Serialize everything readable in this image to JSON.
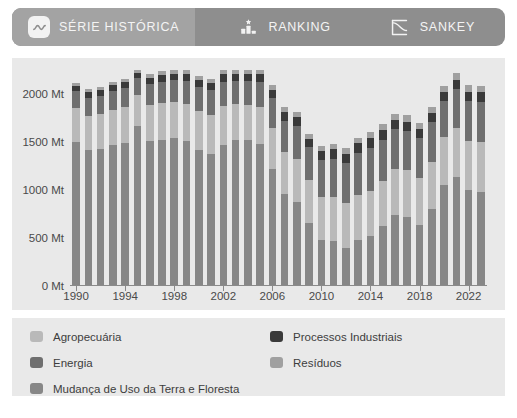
{
  "tabs": [
    {
      "label": "SÉRIE HISTÓRICA",
      "icon": "line-chart-icon",
      "active": true
    },
    {
      "label": "RANKING",
      "icon": "podium-star-icon",
      "active": false
    },
    {
      "label": "SANKEY",
      "icon": "sankey-curve-icon",
      "active": false
    }
  ],
  "colors": {
    "tabbar_bg": "#8e8e8e",
    "tab_active_bg": "#a3a3a3",
    "panel_bg": "#e9e9e9",
    "agropecuaria": "#b9b9b9",
    "energia": "#6f6f6f",
    "mudanca": "#878787",
    "processos": "#3a3a3a",
    "residuos": "#a0a0a0"
  },
  "chart_data": {
    "type": "bar",
    "stacked": true,
    "title": "",
    "xlabel": "",
    "ylabel": "",
    "ylim": [
      0,
      2250
    ],
    "yticks": [
      0,
      500,
      1000,
      1500,
      2000
    ],
    "ytick_labels": [
      "0 Mt",
      "500 Mt",
      "1000 Mt",
      "1500 Mt",
      "2000 Mt"
    ],
    "xtick_labels": [
      "1990",
      "1994",
      "1998",
      "2002",
      "2006",
      "2010",
      "2014",
      "2018",
      "2022"
    ],
    "grid": false,
    "legend_position": "below",
    "unit": "Mt",
    "categories": [
      1990,
      1991,
      1992,
      1993,
      1994,
      1995,
      1996,
      1997,
      1998,
      1999,
      2000,
      2001,
      2002,
      2003,
      2004,
      2005,
      2006,
      2007,
      2008,
      2009,
      2010,
      2011,
      2012,
      2013,
      2014,
      2015,
      2016,
      2017,
      2018,
      2019,
      2020,
      2021,
      2022,
      2023
    ],
    "series": [
      {
        "name": "Mudança de Uso da Terra e Floresta",
        "color": "#878787",
        "values": [
          1500,
          1420,
          1430,
          1470,
          1490,
          1960,
          1510,
          1520,
          1620,
          1520,
          1420,
          1380,
          1480,
          1700,
          1760,
          1640,
          1220,
          960,
          880,
          660,
          480,
          470,
          400,
          480,
          520,
          620,
          740,
          720,
          640,
          800,
          1050,
          1140,
          1000,
          980
        ]
      },
      {
        "name": "Agropecuária",
        "color": "#b9b9b9",
        "values": [
          350,
          355,
          360,
          365,
          370,
          375,
          380,
          385,
          390,
          395,
          400,
          405,
          410,
          415,
          420,
          425,
          430,
          435,
          440,
          445,
          450,
          455,
          460,
          465,
          470,
          475,
          480,
          485,
          490,
          495,
          500,
          505,
          510,
          515
        ]
      },
      {
        "name": "Energia",
        "color": "#6f6f6f",
        "values": [
          180,
          185,
          190,
          195,
          200,
          205,
          215,
          225,
          235,
          240,
          250,
          255,
          260,
          270,
          285,
          295,
          305,
          325,
          345,
          340,
          380,
          400,
          420,
          440,
          450,
          430,
          420,
          415,
          410,
          415,
          380,
          410,
          420,
          425
        ]
      },
      {
        "name": "Processos Industriais",
        "color": "#3a3a3a",
        "values": [
          55,
          56,
          58,
          60,
          62,
          64,
          66,
          68,
          70,
          70,
          72,
          74,
          76,
          78,
          82,
          84,
          86,
          90,
          92,
          86,
          95,
          98,
          98,
          100,
          100,
          96,
          92,
          92,
          92,
          92,
          88,
          95,
          96,
          96
        ]
      },
      {
        "name": "Resíduos",
        "color": "#a0a0a0",
        "values": [
          35,
          36,
          37,
          38,
          39,
          40,
          41,
          42,
          43,
          44,
          45,
          46,
          47,
          48,
          49,
          50,
          52,
          53,
          55,
          56,
          58,
          59,
          60,
          62,
          63,
          64,
          65,
          66,
          67,
          68,
          69,
          70,
          71,
          72
        ]
      }
    ]
  },
  "legend": {
    "left": [
      {
        "label": "Agropecuária",
        "color": "#b9b9b9"
      },
      {
        "label": "Energia",
        "color": "#6f6f6f"
      },
      {
        "label": "Mudança de Uso da Terra e Floresta",
        "color": "#878787"
      }
    ],
    "right": [
      {
        "label": "Processos Industriais",
        "color": "#3a3a3a"
      },
      {
        "label": "Resíduos",
        "color": "#a0a0a0"
      }
    ]
  }
}
